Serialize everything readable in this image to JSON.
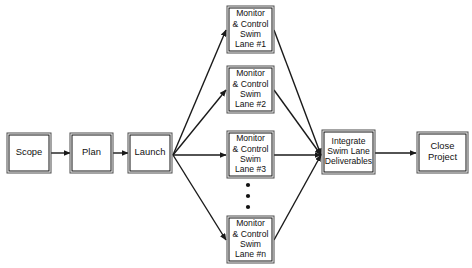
{
  "diagram": {
    "colors": {
      "box_border": "#4a4a4a",
      "box_border_inner": "#111111",
      "line": "#1a1a1a",
      "text": "#111111",
      "background": "#ffffff"
    },
    "nodes": [
      {
        "id": "scope",
        "label": "Scope",
        "lines": [
          "Scope"
        ],
        "x": 7,
        "y": 133,
        "w": 44,
        "h": 40,
        "size": "big"
      },
      {
        "id": "plan",
        "label": "Plan",
        "lines": [
          "Plan"
        ],
        "x": 70,
        "y": 133,
        "w": 43,
        "h": 40,
        "size": "big"
      },
      {
        "id": "launch",
        "label": "Launch",
        "lines": [
          "Launch"
        ],
        "x": 128,
        "y": 133,
        "w": 44,
        "h": 40,
        "size": "big"
      },
      {
        "id": "lane1",
        "label": "Monitor & Control Swim Lane #1",
        "lines": [
          "Monitor",
          "& Control",
          "Swim",
          "Lane #1"
        ],
        "x": 227,
        "y": 6,
        "w": 47,
        "h": 47,
        "size": "small"
      },
      {
        "id": "lane2",
        "label": "Monitor & Control Swim Lane #2",
        "lines": [
          "Monitor",
          "& Control",
          "Swim",
          "Lane #2"
        ],
        "x": 227,
        "y": 66,
        "w": 47,
        "h": 47,
        "size": "small"
      },
      {
        "id": "lane3",
        "label": "Monitor & Control Swim Lane #3",
        "lines": [
          "Monitor",
          "& Control",
          "Swim",
          "Lane #3"
        ],
        "x": 227,
        "y": 131,
        "w": 47,
        "h": 47,
        "size": "small"
      },
      {
        "id": "lanen",
        "label": "Monitor & Control Swim Lane #n",
        "lines": [
          "Monitor",
          "& Control",
          "Swim",
          "Lane #n"
        ],
        "x": 227,
        "y": 216,
        "w": 47,
        "h": 47,
        "size": "small"
      },
      {
        "id": "integrate",
        "label": "Integrate Swim Lane Deliverables",
        "lines": [
          "Integrate",
          "Swim Lane",
          "Deliverables"
        ],
        "x": 322,
        "y": 130,
        "w": 53,
        "h": 44,
        "size": "small"
      },
      {
        "id": "close",
        "label": "Close Project",
        "lines": [
          "Close",
          "Project"
        ],
        "x": 417,
        "y": 132,
        "w": 51,
        "h": 41,
        "size": "big"
      }
    ],
    "ellipsis": {
      "label": "vertical-ellipsis",
      "cx": 248,
      "cy": [
        185,
        196,
        207
      ],
      "r": 2.1
    },
    "edges": [
      {
        "id": "scope-to-plan",
        "from": "Scope",
        "to": "Plan",
        "x1": 51,
        "y1": 153,
        "x2": 70,
        "y2": 153
      },
      {
        "id": "plan-to-launch",
        "from": "Plan",
        "to": "Launch",
        "x1": 113,
        "y1": 153,
        "x2": 128,
        "y2": 153
      },
      {
        "id": "launch-to-lane1",
        "from": "Launch",
        "to": "Monitor & Control Swim Lane #1",
        "x1": 173,
        "y1": 155,
        "x2": 226,
        "y2": 30
      },
      {
        "id": "launch-to-lane2",
        "from": "Launch",
        "to": "Monitor & Control Swim Lane #2",
        "x1": 173,
        "y1": 155,
        "x2": 226,
        "y2": 90
      },
      {
        "id": "launch-to-lane3",
        "from": "Launch",
        "to": "Monitor & Control Swim Lane #3",
        "x1": 173,
        "y1": 155,
        "x2": 226,
        "y2": 155
      },
      {
        "id": "launch-to-lanen",
        "from": "Launch",
        "to": "Monitor & Control Swim Lane #n",
        "x1": 173,
        "y1": 155,
        "x2": 226,
        "y2": 240
      },
      {
        "id": "lane1-to-integrate",
        "from": "Monitor & Control Swim Lane #1",
        "to": "Integrate Swim Lane Deliverables",
        "x1": 274,
        "y1": 30,
        "x2": 321,
        "y2": 155
      },
      {
        "id": "lane2-to-integrate",
        "from": "Monitor & Control Swim Lane #2",
        "to": "Integrate Swim Lane Deliverables",
        "x1": 274,
        "y1": 90,
        "x2": 321,
        "y2": 155
      },
      {
        "id": "lane3-to-integrate",
        "from": "Monitor & Control Swim Lane #3",
        "to": "Integrate Swim Lane Deliverables",
        "x1": 274,
        "y1": 155,
        "x2": 321,
        "y2": 155
      },
      {
        "id": "lanen-to-integrate",
        "from": "Monitor & Control Swim Lane #n",
        "to": "Integrate Swim Lane Deliverables",
        "x1": 274,
        "y1": 240,
        "x2": 321,
        "y2": 155
      },
      {
        "id": "integrate-to-close",
        "from": "Integrate Swim Lane Deliverables",
        "to": "Close Project",
        "x1": 375,
        "y1": 153,
        "x2": 416,
        "y2": 153
      }
    ]
  }
}
